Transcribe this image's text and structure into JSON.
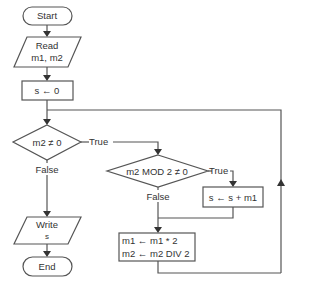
{
  "flowchart": {
    "start": {
      "label": "Start"
    },
    "read": {
      "line1": "Read",
      "line2": "m1, m2"
    },
    "init": {
      "label": "s ← 0"
    },
    "decision1": {
      "label": "m2 ≠ 0",
      "true_label": "True",
      "false_label": "False"
    },
    "decision2": {
      "label": "m2 MOD 2 ≠ 0",
      "true_label": "True",
      "false_label": "False"
    },
    "add": {
      "label": "s ← s + m1"
    },
    "update": {
      "line1": "m1 ← m1 * 2",
      "line2": "m2 ← m2 DIV 2"
    },
    "write": {
      "line1": "Write",
      "line2": "s"
    },
    "end": {
      "label": "End"
    }
  },
  "colors": {
    "stroke": "#555555",
    "arrow": "#333333",
    "text": "#333333",
    "background": "#ffffff"
  }
}
